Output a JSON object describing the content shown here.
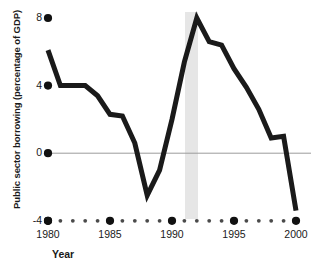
{
  "chart_data": {
    "type": "line",
    "title": "",
    "xlabel": "Year",
    "ylabel": "Public sector borrowing (percentage of GDP)",
    "xlim": [
      1980,
      2000
    ],
    "ylim": [
      -4,
      8
    ],
    "grid": false,
    "zero_line": true,
    "legend": "none",
    "line_color": "#1a1a1a",
    "line_width": 5,
    "highlight_band": {
      "start": 1991,
      "end": 1992,
      "color": "#e3e3e3"
    },
    "x": [
      1980,
      1981,
      1982,
      1983,
      1984,
      1985,
      1986,
      1987,
      1988,
      1989,
      1990,
      1991,
      1992,
      1993,
      1994,
      1995,
      1996,
      1997,
      1998,
      1999,
      2000
    ],
    "values": [
      6.1,
      4.0,
      4.0,
      4.0,
      3.4,
      2.3,
      2.2,
      0.6,
      -2.5,
      -1.0,
      2.0,
      5.4,
      8.0,
      6.6,
      6.4,
      5.0,
      3.9,
      2.6,
      0.9,
      1.0,
      -3.4
    ],
    "series": [
      {
        "name": "Public sector borrowing",
        "values": [
          6.1,
          4.0,
          4.0,
          4.0,
          3.4,
          2.3,
          2.2,
          0.6,
          -2.5,
          -1.0,
          2.0,
          5.4,
          8.0,
          6.6,
          6.4,
          5.0,
          3.9,
          2.6,
          0.9,
          1.0,
          -3.4
        ]
      }
    ],
    "ytick_values": [
      8,
      4,
      0,
      -4
    ],
    "ytick_labels": [
      "8",
      "4",
      "0",
      "-4"
    ],
    "xtick_major_values": [
      1980,
      1985,
      1990,
      1995,
      2000
    ],
    "xtick_major_labels": [
      "1980",
      "1985",
      "1990",
      "1995",
      "2000"
    ],
    "xtick_minor_values": [
      1981,
      1982,
      1983,
      1984,
      1986,
      1987,
      1988,
      1989,
      1991,
      1992,
      1993,
      1994,
      1996,
      1997,
      1998,
      1999
    ],
    "tick_style": "dots"
  },
  "axis": {
    "y_title": "Public sector borrowing (percentage of GDP)",
    "x_title": "Year",
    "y_labels": {
      "t0": "8",
      "t1": "4",
      "t2": "0",
      "t3": "-4"
    },
    "x_labels": {
      "t0": "1980",
      "t1": "1985",
      "t2": "1990",
      "t3": "1995",
      "t4": "2000"
    }
  }
}
